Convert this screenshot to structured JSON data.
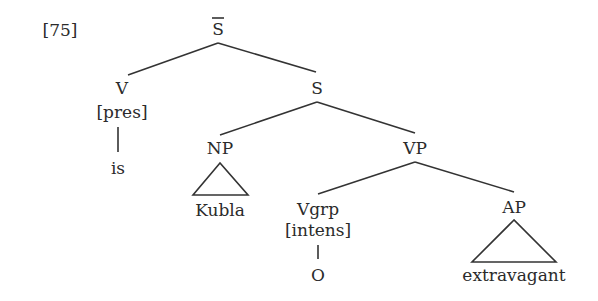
{
  "example_number": "[75]",
  "tree": {
    "root": "S̄",
    "nodes": {
      "sbar": "S",
      "v": "V",
      "v_feature": "[pres]",
      "v_leaf": "is",
      "s": "S",
      "np": "NP",
      "np_leaf": "Kubla",
      "vp": "VP",
      "vgrp": "Vgrp",
      "vgrp_feature": "[intens]",
      "vgrp_leaf": "O",
      "ap": "AP",
      "ap_leaf": "extravagant"
    },
    "structure": "[S̄ [V[pres] is] [S [NP Kubla] [VP [Vgrp[intens] O] [AP extravagant]]]]"
  },
  "colors": {
    "ink": "#2b2b2b",
    "background": "#ffffff"
  }
}
